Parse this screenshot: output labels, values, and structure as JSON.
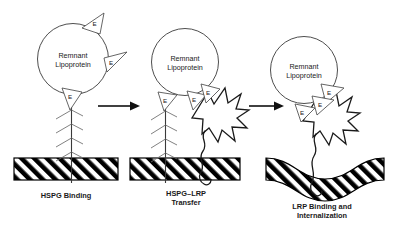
{
  "figure": {
    "background_color": "#ffffff",
    "ink_color": "#1a1a1a",
    "width": 394,
    "height": 228
  },
  "panels": [
    {
      "id": "panel-1",
      "caption_lines": [
        "HSPG Binding"
      ],
      "particle_label_line1": "Remnant",
      "particle_label_line2": "Lipoprotein",
      "apoe_count": 3,
      "apoe_letter": "E",
      "has_hspg": true,
      "has_lrp": false,
      "membrane_shape": "flat"
    },
    {
      "id": "panel-2",
      "caption_lines": [
        "HSPG–LRP",
        "Transfer"
      ],
      "particle_label_line1": "Remnant",
      "particle_label_line2": "Lipoprotein",
      "apoe_count": 3,
      "apoe_letter": "E",
      "has_hspg": true,
      "has_lrp": true,
      "membrane_shape": "flat"
    },
    {
      "id": "panel-3",
      "caption_lines": [
        "LRP Binding and",
        "Internalization"
      ],
      "particle_label_line1": "Remnant",
      "particle_label_line2": "Lipoprotein",
      "apoe_count": 3,
      "apoe_letter": "E",
      "has_hspg": false,
      "has_lrp": true,
      "membrane_shape": "invaginated"
    }
  ],
  "arrows": [
    {
      "id": "arrow-1",
      "from": "panel-1",
      "to": "panel-2"
    },
    {
      "id": "arrow-2",
      "from": "panel-2",
      "to": "panel-3"
    }
  ],
  "legend_terms": {
    "apoe": "E",
    "hspg": "HSPG",
    "lrp": "LRP"
  }
}
